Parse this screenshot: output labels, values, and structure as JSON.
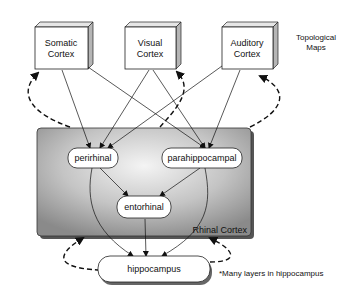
{
  "diagram": {
    "title_note": [
      "Topological",
      "Maps"
    ],
    "cortices": [
      {
        "id": "somatic",
        "lines": [
          "Somatic",
          "Cortex"
        ]
      },
      {
        "id": "visual",
        "lines": [
          "Visual",
          "Cortex"
        ]
      },
      {
        "id": "auditory",
        "lines": [
          "Auditory",
          "Cortex"
        ]
      }
    ],
    "region_label": "Rhinal Cortex",
    "nodes": {
      "perirhinal": "perirhinal",
      "parahippocampal": "parahippocampal",
      "entorhinal": "entorhinal",
      "hippocampus": "hippocampus"
    },
    "footnote": "*Many layers in hippocampus",
    "edges_solid": [
      [
        "somatic",
        "perirhinal"
      ],
      [
        "somatic",
        "parahippocampal"
      ],
      [
        "visual",
        "perirhinal"
      ],
      [
        "visual",
        "parahippocampal"
      ],
      [
        "auditory",
        "perirhinal"
      ],
      [
        "auditory",
        "parahippocampal"
      ],
      [
        "perirhinal",
        "entorhinal"
      ],
      [
        "parahippocampal",
        "entorhinal"
      ],
      [
        "perirhinal",
        "hippocampus"
      ],
      [
        "parahippocampal",
        "hippocampus"
      ],
      [
        "entorhinal",
        "hippocampus"
      ]
    ],
    "edges_dashed_feedback": [
      [
        "rhinal-cortex",
        "somatic"
      ],
      [
        "rhinal-cortex",
        "visual"
      ],
      [
        "rhinal-cortex",
        "auditory"
      ],
      [
        "hippocampus",
        "rhinal-cortex-left"
      ],
      [
        "hippocampus",
        "rhinal-cortex-right"
      ]
    ],
    "colors": {
      "region_fill_dark": "#8a8a8a",
      "region_fill_light": "#f2f2f2",
      "stroke": "#111111"
    }
  }
}
